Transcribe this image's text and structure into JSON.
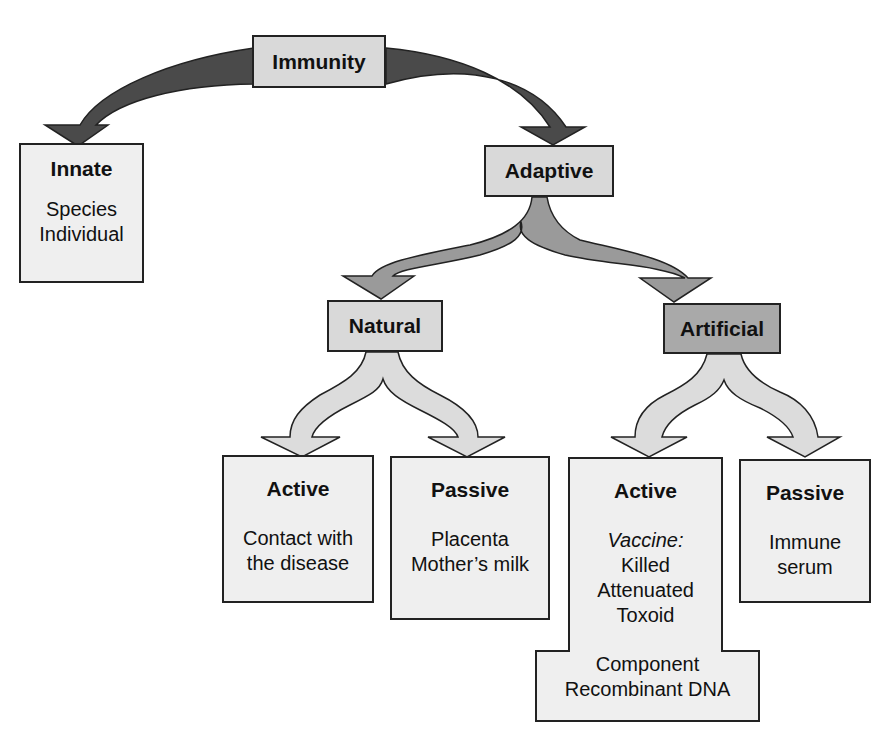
{
  "diagram": {
    "root": {
      "label": "Immunity"
    },
    "innate": {
      "label": "Innate",
      "items": [
        "Species",
        "Individual"
      ]
    },
    "adaptive": {
      "label": "Adaptive"
    },
    "natural": {
      "label": "Natural",
      "active": {
        "label": "Active",
        "items": [
          "Contact with",
          "the disease"
        ]
      },
      "passive": {
        "label": "Passive",
        "items": [
          "Placenta",
          "Mother’s milk"
        ]
      }
    },
    "artificial": {
      "label": "Artificial",
      "active": {
        "label": "Active",
        "subheading": "Vaccine:",
        "items": [
          "Killed",
          "Attenuated",
          "Toxoid",
          "Component",
          "Recombinant DNA"
        ]
      },
      "passive": {
        "label": "Passive",
        "items": [
          "Immune",
          "serum"
        ]
      }
    }
  },
  "colors": {
    "arrow_top": "#4a4a4a",
    "arrow_mid": "#9a9a9a",
    "arrow_low": "#dcdcdc",
    "box_light": "#d9d9d9",
    "box_pale": "#efefef",
    "box_dark": "#a9a9a9",
    "outline": "#222222"
  }
}
